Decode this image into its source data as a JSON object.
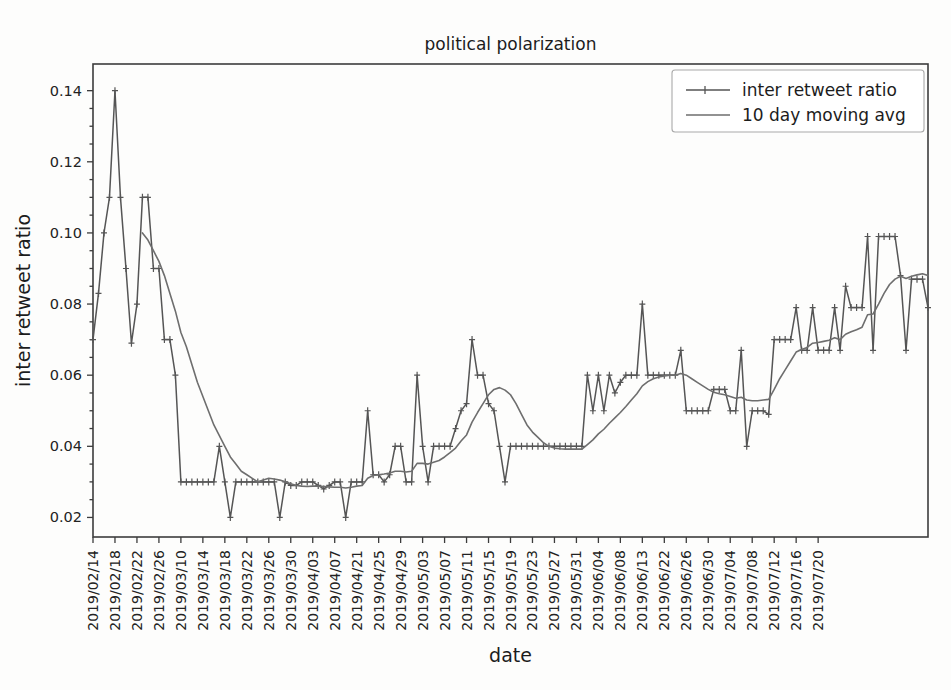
{
  "chart_data": {
    "type": "line",
    "title": "political polarization",
    "xlabel": "date",
    "ylabel": "inter retweet ratio",
    "ylim": [
      0.0145,
      0.1475
    ],
    "yticks": [
      0.02,
      0.04,
      0.06,
      0.08,
      0.1,
      0.12,
      0.14
    ],
    "yticklabels": [
      "0.02",
      "0.04",
      "0.06",
      "0.08",
      "0.10",
      "0.12",
      "0.14"
    ],
    "grid": false,
    "legend_position": "upper right",
    "legend": [
      "inter retweet ratio",
      "10 day moving avg"
    ],
    "xticklabels": [
      "2019/02/14",
      "2019/02/18",
      "2019/02/22",
      "2019/02/26",
      "2019/03/10",
      "2019/03/14",
      "2019/03/18",
      "2019/03/22",
      "2019/03/26",
      "2019/03/30",
      "2019/04/03",
      "2019/04/07",
      "2019/04/21",
      "2019/04/25",
      "2019/04/29",
      "2019/05/03",
      "2019/05/07",
      "2019/05/11",
      "2019/05/15",
      "2019/05/19",
      "2019/05/23",
      "2019/05/27",
      "2019/05/31",
      "2019/06/04",
      "2019/06/08",
      "2019/06/13",
      "2019/06/22",
      "2019/06/26",
      "2019/06/30",
      "2019/07/04",
      "2019/07/08",
      "2019/07/12",
      "2019/07/16",
      "2019/07/20"
    ],
    "xtick_indices": [
      0,
      4,
      8,
      12,
      16,
      20,
      24,
      28,
      32,
      36,
      40,
      44,
      48,
      52,
      56,
      60,
      64,
      68,
      72,
      76,
      80,
      84,
      88,
      92,
      96,
      100,
      104,
      108,
      112,
      116,
      120,
      124,
      128,
      132
    ],
    "series": [
      {
        "name": "inter retweet ratio",
        "marker": "plus",
        "color": "#555555",
        "values": [
          0.07,
          0.083,
          0.1,
          0.11,
          0.14,
          0.11,
          0.09,
          0.069,
          0.08,
          0.11,
          0.11,
          0.09,
          0.09,
          0.07,
          0.07,
          0.06,
          0.03,
          0.03,
          0.03,
          0.03,
          0.03,
          0.03,
          0.03,
          0.04,
          0.03,
          0.02,
          0.03,
          0.03,
          0.03,
          0.03,
          0.03,
          0.03,
          0.03,
          0.03,
          0.02,
          0.03,
          0.029,
          0.029,
          0.03,
          0.03,
          0.03,
          0.029,
          0.028,
          0.029,
          0.03,
          0.03,
          0.02,
          0.03,
          0.03,
          0.03,
          0.05,
          0.032,
          0.032,
          0.03,
          0.032,
          0.04,
          0.04,
          0.03,
          0.03,
          0.06,
          0.04,
          0.03,
          0.04,
          0.04,
          0.04,
          0.04,
          0.045,
          0.05,
          0.052,
          0.07,
          0.06,
          0.06,
          0.052,
          0.05,
          0.04,
          0.03,
          0.04,
          0.04,
          0.04,
          0.04,
          0.04,
          0.04,
          0.04,
          0.04,
          0.04,
          0.04,
          0.04,
          0.04,
          0.04,
          0.04,
          0.06,
          0.05,
          0.06,
          0.05,
          0.06,
          0.055,
          0.058,
          0.06,
          0.06,
          0.06,
          0.08,
          0.06,
          0.06,
          0.06,
          0.06,
          0.06,
          0.06,
          0.067,
          0.05,
          0.05,
          0.05,
          0.05,
          0.05,
          0.056,
          0.056,
          0.056,
          0.05,
          0.05,
          0.067,
          0.04,
          0.05,
          0.05,
          0.05,
          0.049,
          0.07,
          0.07,
          0.07,
          0.07,
          0.079,
          0.067,
          0.067,
          0.079,
          0.067,
          0.067,
          0.067,
          0.079,
          0.067,
          0.085,
          0.079,
          0.079,
          0.079,
          0.099,
          0.067,
          0.099,
          0.099,
          0.099,
          0.099,
          0.088,
          0.067,
          0.087,
          0.087,
          0.087,
          0.079
        ]
      },
      {
        "name": "10 day moving avg",
        "marker": "none",
        "color": "#6e6e6e",
        "values": [
          null,
          null,
          null,
          null,
          null,
          null,
          null,
          null,
          null,
          0.1,
          0.098,
          0.095,
          0.092,
          0.088,
          0.083,
          0.078,
          0.072,
          0.068,
          0.063,
          0.058,
          0.054,
          0.05,
          0.046,
          0.043,
          0.04,
          0.037,
          0.035,
          0.033,
          0.032,
          0.031,
          0.03,
          0.0305,
          0.031,
          0.0308,
          0.0305,
          0.03,
          0.0295,
          0.029,
          0.0288,
          0.0287,
          0.0288,
          0.0288,
          0.0287,
          0.0286,
          0.0285,
          0.0285,
          0.0283,
          0.0285,
          0.0288,
          0.029,
          0.031,
          0.0318,
          0.032,
          0.0322,
          0.0325,
          0.033,
          0.033,
          0.0328,
          0.033,
          0.0352,
          0.0352,
          0.035,
          0.0355,
          0.036,
          0.037,
          0.0382,
          0.0395,
          0.0415,
          0.0432,
          0.0468,
          0.0495,
          0.052,
          0.0545,
          0.056,
          0.0565,
          0.0558,
          0.0545,
          0.052,
          0.049,
          0.046,
          0.044,
          0.0425,
          0.041,
          0.04,
          0.0395,
          0.0393,
          0.0392,
          0.0392,
          0.0392,
          0.0392,
          0.0405,
          0.0418,
          0.0435,
          0.0448,
          0.0465,
          0.048,
          0.0495,
          0.0512,
          0.053,
          0.0548,
          0.057,
          0.0582,
          0.059,
          0.0595,
          0.0598,
          0.06,
          0.06,
          0.0605,
          0.06,
          0.059,
          0.058,
          0.057,
          0.056,
          0.0552,
          0.0548,
          0.0545,
          0.054,
          0.0535,
          0.0538,
          0.053,
          0.0528,
          0.0528,
          0.053,
          0.0532,
          0.056,
          0.059,
          0.0615,
          0.064,
          0.0665,
          0.0672,
          0.0678,
          0.069,
          0.0692,
          0.0695,
          0.0698,
          0.0705,
          0.07,
          0.0715,
          0.0722,
          0.0728,
          0.0735,
          0.077,
          0.0772,
          0.08,
          0.083,
          0.0855,
          0.087,
          0.0878,
          0.0872,
          0.0878,
          0.0882,
          0.0885,
          0.088
        ]
      }
    ]
  }
}
